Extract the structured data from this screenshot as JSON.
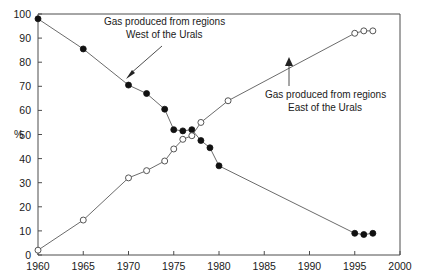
{
  "chart_data": {
    "type": "line",
    "title": "",
    "xlabel": "",
    "ylabel": "%",
    "xlim": [
      1960,
      2000
    ],
    "ylim": [
      0,
      100
    ],
    "xticks": [
      1960,
      1965,
      1970,
      1975,
      1980,
      1985,
      1990,
      1995,
      2000
    ],
    "yticks": [
      0,
      10,
      20,
      30,
      40,
      50,
      60,
      70,
      80,
      90,
      100
    ],
    "grid": false,
    "legend": "none",
    "series": [
      {
        "name": "Gas produced from regions West of the Urals",
        "marker": "filled-circle",
        "x": [
          1960,
          1965,
          1970,
          1972,
          1974,
          1975,
          1976,
          1977,
          1978,
          1979,
          1980,
          1995,
          1996,
          1997
        ],
        "values": [
          98,
          85.5,
          70.5,
          67,
          60.5,
          52,
          51.5,
          52,
          47.5,
          44.5,
          37,
          9,
          8.5,
          9
        ]
      },
      {
        "name": "Gas produced from regions East of the Urals",
        "marker": "open-circle",
        "x": [
          1960,
          1965,
          1970,
          1972,
          1974,
          1975,
          1976,
          1977,
          1978,
          1981,
          1995,
          1996,
          1997
        ],
        "values": [
          2,
          14.5,
          32,
          35,
          39,
          44,
          48,
          49.5,
          55,
          64,
          92,
          93,
          93
        ]
      }
    ],
    "annotations": [
      {
        "text_line1": "Gas produced from regions",
        "text_line2": "West of the Urals",
        "points_to_series": "Gas produced from regions West of the Urals"
      },
      {
        "text_line1": "Gas produced from regions",
        "text_line2": "East of the Urals",
        "points_to_series": "Gas produced from regions East of the Urals"
      }
    ]
  }
}
